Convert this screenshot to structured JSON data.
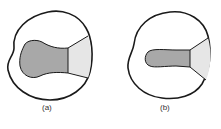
{
  "figures": [
    {
      "label": "(a)",
      "description": "outline with wide dark-shaded region extending to light-shaded right edge"
    },
    {
      "label": "(b)",
      "description": "outline with narrow dark-shaded region extending to light-shaded right edge"
    }
  ],
  "colors": {
    "outline": "#1a1a1a",
    "dark_fill": "#a8a8a8",
    "light_fill": "#e6e6e6",
    "background": "#ffffff"
  }
}
